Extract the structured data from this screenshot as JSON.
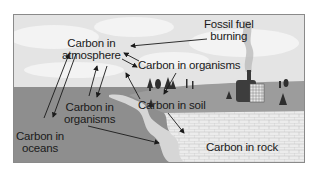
{
  "diagram": {
    "labels": {
      "atmosphere_l1": "Carbon in",
      "atmosphere_l2": "atmosphere",
      "fossil_l1": "Fossil fuel",
      "fossil_l2": "burning",
      "organisms_land": "Carbon in organisms",
      "organisms_sea_l1": "Carbon in",
      "organisms_sea_l2": "organisms",
      "soil": "Carbon in soil",
      "oceans_l1": "Carbon in",
      "oceans_l2": "oceans",
      "rock": "Carbon in rock"
    },
    "colors": {
      "sky": "#e4e4e4",
      "cloud": "#f2f2f2",
      "ocean": "#8c8c8c",
      "land": "#9a9a9a",
      "shore": "#d8d8d8",
      "rock": "#ececec",
      "rock_lines": "#bdbdbd",
      "arrow": "#1a1a1a",
      "frame": "#8a8a8a"
    },
    "icons": [
      "factory-icon",
      "smoke-icon",
      "tree-icon",
      "arrow-icon"
    ]
  }
}
